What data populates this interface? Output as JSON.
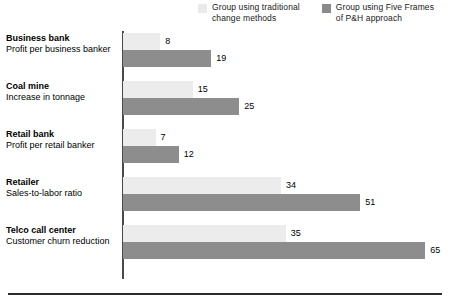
{
  "legend": {
    "entries": [
      {
        "label": "Group using traditional\nchange methods",
        "swatch": "light",
        "color": "#ececec"
      },
      {
        "label": "Group using Five Frames\nof P&H approach",
        "swatch": "dark",
        "color": "#8d8d8d"
      }
    ]
  },
  "chart_data": {
    "type": "bar",
    "orientation": "horizontal",
    "title": "",
    "xlabel": "",
    "ylabel": "",
    "grid": false,
    "legend_position": "top-right",
    "xlim": [
      0,
      70
    ],
    "categories": [
      "Business bank",
      "Coal mine",
      "Retail bank",
      "Retailer",
      "Telco call center"
    ],
    "category_metrics": [
      "Profit per business banker",
      "Increase in tonnage",
      "Profit per retail banker",
      "Sales-to-labor ratio",
      "Customer churn reduction"
    ],
    "series": [
      {
        "name": "Group using traditional change methods",
        "color": "#ececec",
        "values": [
          8,
          15,
          7,
          34,
          35
        ]
      },
      {
        "name": "Group using Five Frames of P&H approach",
        "color": "#8d8d8d",
        "values": [
          19,
          25,
          12,
          51,
          65
        ]
      }
    ]
  }
}
